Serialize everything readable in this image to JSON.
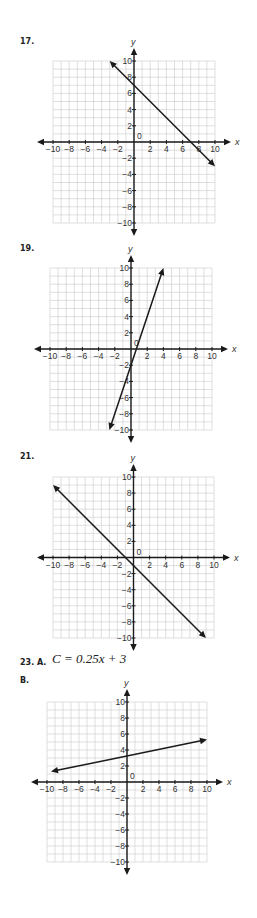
{
  "problems": [
    {
      "label": "17."
    },
    {
      "label": "19."
    },
    {
      "label": "21."
    },
    {
      "label": "23. A.",
      "equation": "C = 0.25x + 3",
      "sub_label": "B."
    }
  ],
  "axis": {
    "x_name": "x",
    "y_name": "y",
    "origin_label": "0"
  },
  "colors": {
    "grid": "#c9c9c9",
    "axis": "#1a1a1a",
    "line": "#1a1a1a",
    "text": "#333333"
  },
  "chart_data": [
    {
      "type": "line",
      "title": "17.",
      "xlabel": "x",
      "ylabel": "y",
      "xlim": [
        -10,
        10
      ],
      "ylim": [
        -10,
        10
      ],
      "grid": true,
      "grid_step": 1,
      "xticks": [
        -10,
        -8,
        -6,
        -4,
        -2,
        2,
        4,
        6,
        8,
        10
      ],
      "yticks": [
        -10,
        -8,
        -6,
        -4,
        -2,
        2,
        4,
        6,
        8,
        10
      ],
      "series": [
        {
          "name": "y = -x + 7",
          "points": [
            [
              -3,
              10
            ],
            [
              10,
              -3
            ]
          ],
          "arrows": "both"
        }
      ]
    },
    {
      "type": "line",
      "title": "19.",
      "xlabel": "x",
      "ylabel": "y",
      "xlim": [
        -10,
        10
      ],
      "ylim": [
        -10,
        10
      ],
      "grid": true,
      "grid_step": 1,
      "xticks": [
        -10,
        -8,
        -6,
        -4,
        -2,
        2,
        4,
        6,
        8,
        10
      ],
      "yticks": [
        -10,
        -8,
        -6,
        -4,
        -2,
        2,
        4,
        6,
        8,
        10
      ],
      "series": [
        {
          "name": "y = 3x - 2",
          "points": [
            [
              -2.67,
              -10
            ],
            [
              4,
              10
            ]
          ],
          "arrows": "both"
        }
      ]
    },
    {
      "type": "line",
      "title": "21.",
      "xlabel": "x",
      "ylabel": "y",
      "xlim": [
        -10,
        10
      ],
      "ylim": [
        -10,
        10
      ],
      "grid": true,
      "grid_step": 1,
      "xticks": [
        -10,
        -8,
        -6,
        -4,
        -2,
        2,
        4,
        6,
        8,
        10
      ],
      "yticks": [
        -10,
        -8,
        -6,
        -4,
        -2,
        2,
        4,
        6,
        8,
        10
      ],
      "series": [
        {
          "name": "y = -x - 1",
          "points": [
            [
              -10,
              9
            ],
            [
              9,
              -10
            ]
          ],
          "arrows": "both"
        }
      ]
    },
    {
      "type": "line",
      "title": "23. B.",
      "xlabel": "x",
      "ylabel": "y",
      "xlim": [
        -10,
        10
      ],
      "ylim": [
        -10,
        10
      ],
      "grid": true,
      "grid_step": 1,
      "xticks": [
        -10,
        -8,
        -6,
        -4,
        -2,
        2,
        4,
        6,
        8,
        10
      ],
      "yticks": [
        -10,
        -8,
        -6,
        -4,
        -2,
        2,
        4,
        6,
        8,
        10
      ],
      "series": [
        {
          "name": "C = 0.25x + 3",
          "points": [
            [
              -9.5,
              1.3
            ],
            [
              10,
              5.3
            ]
          ],
          "arrows": "both"
        }
      ]
    }
  ],
  "layout": [
    {
      "label_pos": [
        20,
        37
      ],
      "grid": {
        "left": 53,
        "top": 61,
        "size": 162
      }
    },
    {
      "label_pos": [
        20,
        244
      ],
      "grid": {
        "left": 50,
        "top": 268,
        "size": 162
      }
    },
    {
      "label_pos": [
        20,
        452
      ],
      "grid": {
        "left": 53,
        "top": 477,
        "size": 161
      }
    },
    {
      "label_pos": [
        20,
        657
      ],
      "grid": {
        "left": 47,
        "top": 702,
        "size": 160
      }
    }
  ]
}
